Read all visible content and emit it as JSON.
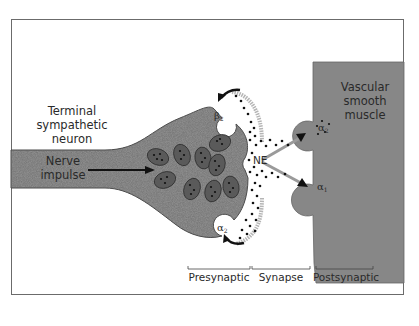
{
  "figure": {
    "labels": {
      "neuron": [
        "Terminal",
        "sympathetic",
        "neuron"
      ],
      "impulse": [
        "Nerve",
        "impulse"
      ],
      "muscle": [
        "Vascular",
        "smooth",
        "muscle"
      ],
      "transmitter": "NE"
    },
    "receptors": {
      "beta2_presynaptic": {
        "symbol": "β",
        "sub": "2"
      },
      "alpha2_presynaptic": {
        "symbol": "α",
        "sub": "2"
      },
      "alpha2_postsynaptic": {
        "symbol": "α",
        "sub": "2"
      },
      "alpha1_postsynaptic": {
        "symbol": "α",
        "sub": "1"
      }
    },
    "regions": [
      "Presynaptic",
      "Synapse",
      "Postsynaptic"
    ],
    "colors": {
      "neuron_fill": "#8c8c8c",
      "vesicle_fill": "#5e5e5e",
      "muscle_fill": "#888888",
      "frame": "#6b6b6b",
      "text": "#2a2a2a"
    }
  }
}
